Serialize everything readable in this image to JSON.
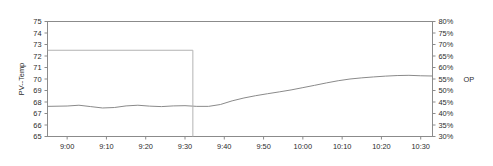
{
  "chart_data": {
    "type": "line",
    "title": "",
    "xlabel": "",
    "ylabel": "PV--Temp",
    "y2label": "OP",
    "grid": false,
    "legend_position": "right-axis-inline",
    "x_ticks": [
      "9:00",
      "9:10",
      "9:20",
      "9:30",
      "9:40",
      "9:50",
      "10:00",
      "10:10",
      "10:20",
      "10:30"
    ],
    "x_tick_minutes": [
      540,
      550,
      560,
      570,
      580,
      590,
      600,
      610,
      620,
      630
    ],
    "xlim_minutes": [
      535,
      633
    ],
    "y_ticks": [
      "75",
      "74",
      "73",
      "72",
      "71",
      "70",
      "69",
      "68",
      "67",
      "66",
      "65"
    ],
    "y_tick_values": [
      75,
      74,
      73,
      72,
      71,
      70,
      69,
      68,
      67,
      66,
      65
    ],
    "ylim": [
      65,
      75
    ],
    "y2_ticks": [
      "80%",
      "75%",
      "70%",
      "65%",
      "60%",
      "55%",
      "50%",
      "45%",
      "40%",
      "35%",
      "30%"
    ],
    "y2_tick_values": [
      80,
      75,
      70,
      65,
      60,
      55,
      50,
      45,
      40,
      35,
      30
    ],
    "y2lim": [
      30,
      80
    ],
    "series": [
      {
        "name": "PV--Temp",
        "axis": "left",
        "color": "#8a8a8a",
        "x": [
          535,
          540,
          543,
          546,
          549,
          552,
          555,
          558,
          561,
          564,
          567,
          570,
          573,
          576,
          579,
          582,
          585,
          588,
          591,
          594,
          597,
          600,
          603,
          606,
          609,
          612,
          615,
          618,
          621,
          624,
          627,
          630,
          633
        ],
        "values": [
          67.62,
          67.65,
          67.72,
          67.6,
          67.48,
          67.52,
          67.66,
          67.72,
          67.64,
          67.6,
          67.66,
          67.68,
          67.62,
          67.62,
          67.78,
          68.1,
          68.35,
          68.55,
          68.72,
          68.88,
          69.05,
          69.25,
          69.45,
          69.66,
          69.85,
          70.0,
          70.1,
          70.18,
          70.25,
          70.3,
          70.32,
          70.28,
          70.26
        ]
      },
      {
        "name": "OP",
        "axis": "right",
        "color": "#b3b3b3",
        "step": true,
        "x": [
          535,
          572,
          572,
          633
        ],
        "values": [
          72.5,
          72.5,
          55.0,
          55.0
        ]
      }
    ],
    "annotations": [
      {
        "text": "OP",
        "at_y2": 55,
        "side": "right"
      }
    ]
  },
  "axes": {
    "left_title": "PV--Temp",
    "right_annot": "OP"
  }
}
